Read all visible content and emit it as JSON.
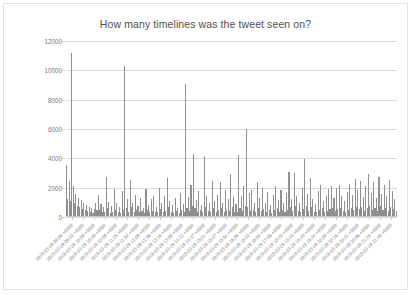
{
  "chart": {
    "title": "How many timelines was the tweet seen on?",
    "border_color": "#e2e2e2",
    "bar_color": "#8f8f8f",
    "grid_color": "#dcdcdc",
    "background": "#ffffff"
  },
  "chart_data": {
    "type": "bar",
    "title": "How many timelines was the tweet seen on?",
    "xlabel": "",
    "ylabel": "",
    "ylim": [
      0,
      12000
    ],
    "ytick_values": [
      0,
      2000,
      4000,
      6000,
      8000,
      10000,
      12000
    ],
    "ytick_labels": [
      "0",
      "2000",
      "4000",
      "6000",
      "8000",
      "10000",
      "12000"
    ],
    "grid": true,
    "legend": false,
    "xtick_labels": [
      "2018-03-29 09:06 +0000",
      "2018-03-29 09:32 +0000",
      "2018-03-29 10:00 +0000",
      "2018-03-29 10:20 +0000",
      "2018-03-29 10:59 +0000",
      "2018-03-29 11:25 +0000",
      "2018-03-29 11:52 +0000",
      "2018-03-29 12:09 +0000",
      "2018-03-29 12:36 +0000",
      "2018-03-29 13:16 +0000",
      "2018-03-29 13:50 +0000",
      "2018-03-29 14:12 +0000",
      "2018-03-29 14:37 +0000",
      "2018-03-29 15:01 +0000",
      "2018-03-29 15:27 +0000",
      "2018-03-29 15:51 +0000",
      "2018-03-29 16:08 +0000",
      "2018-03-29 16:32 +0000",
      "2018-03-29 16:54 +0000",
      "2018-03-29 17:55 +0000",
      "2018-03-29 18:20 +0000",
      "2018-03-29 18:43 +0000",
      "2018-03-29 19:20 +0000",
      "2018-03-29 19:44 +0000",
      "2018-03-29 20:00 +0000",
      "2018-03-29 20:16 +0000",
      "2018-03-29 20:41 +0000",
      "2018-03-29 20:56 +0000",
      "2018-03-29 21:18 +0000",
      "2018-03-29 21:45 +0000"
    ],
    "notable_peaks": [
      {
        "label": "2018-03-29 09:06 +0000",
        "value": 11200
      },
      {
        "label": "2018-03-29 10:20 +0000",
        "value": 10300
      },
      {
        "label": "2018-03-29 13:16 +0000",
        "value": 9050
      },
      {
        "label": "2018-03-29 15:51 +0000",
        "value": 6000
      },
      {
        "label": "2018-03-29 13:50 +0000",
        "value": 4250
      },
      {
        "label": "2018-03-29 15:27 +0000",
        "value": 4200
      },
      {
        "label": "2018-03-29 14:12 +0000",
        "value": 4100
      },
      {
        "label": "2018-03-29 18:43 +0000",
        "value": 3900
      }
    ],
    "values": [
      3500,
      1200,
      2400,
      1050,
      11200,
      2050,
      900,
      1500,
      700,
      1250,
      600,
      1100,
      450,
      900,
      380,
      760,
      320,
      640,
      280,
      520,
      240,
      460,
      900,
      420,
      1450,
      380,
      820,
      300,
      640,
      260,
      2650,
      540,
      980,
      230,
      700,
      300,
      1850,
      420,
      860,
      260,
      620,
      240,
      1700,
      380,
      10300,
      520,
      1150,
      280,
      2450,
      640,
      900,
      300,
      1450,
      380,
      700,
      260,
      1250,
      320,
      560,
      230,
      1850,
      420,
      760,
      270,
      1150,
      340,
      1400,
      300,
      640,
      250,
      1950,
      460,
      880,
      290,
      1350,
      360,
      2600,
      620,
      1050,
      280,
      740,
      240,
      1250,
      330,
      580,
      220,
      1550,
      400,
      820,
      270,
      9050,
      520,
      1300,
      310,
      2150,
      680,
      4250,
      560,
      1100,
      290,
      1700,
      420,
      760,
      250,
      4100,
      620,
      1350,
      340,
      880,
      270,
      2400,
      520,
      1050,
      300,
      1450,
      380,
      2300,
      560,
      900,
      260,
      1750,
      440,
      1150,
      320,
      2900,
      640,
      1300,
      290,
      820,
      250,
      4200,
      580,
      1400,
      360,
      2050,
      700,
      6000,
      620,
      1550,
      330,
      1800,
      420,
      900,
      270,
      2350,
      580,
      1250,
      340,
      1950,
      460,
      880,
      280,
      1650,
      400,
      760,
      240,
      1450,
      380,
      2050,
      520,
      1100,
      300,
      1750,
      430,
      920,
      270,
      1550,
      390,
      3050,
      600,
      1200,
      320,
      2950,
      660,
      1400,
      350,
      880,
      260,
      1950,
      480,
      3900,
      700,
      1500,
      370,
      2600,
      620,
      1150,
      300,
      820,
      250,
      1700,
      430,
      2100,
      520,
      1050,
      290,
      1400,
      360,
      1850,
      460,
      2050,
      540,
      1250,
      330,
      1950,
      500,
      2100,
      560,
      1350,
      360,
      1050,
      300,
      1650,
      430,
      2200,
      580,
      1450,
      380,
      2550,
      640,
      1750,
      460,
      2400,
      600,
      1300,
      350,
      2050,
      520,
      2850,
      700,
      1600,
      420,
      2350,
      580,
      1250,
      340,
      2650,
      680,
      1500,
      400,
      2100,
      550,
      1350,
      370,
      2450,
      620,
      1700,
      450,
      1150,
      320
    ]
  }
}
